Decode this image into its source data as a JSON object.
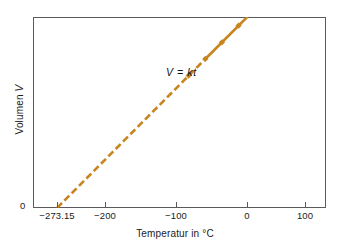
{
  "chart_data": {
    "type": "line",
    "title": "",
    "xlabel": "Temperatur in °C",
    "ylabel": "Volumen V",
    "annotation": "V = kt",
    "xlim": [
      -273.15,
      130
    ],
    "ylim": [
      0,
      1
    ],
    "grid": false,
    "legend": "none",
    "line_color": "#c8841e",
    "axis_color": "#5a5a5e",
    "x_ticks": [
      {
        "value": -273.15,
        "label": "−273.15",
        "px": 57
      },
      {
        "value": -200,
        "label": "−200",
        "px": 105
      },
      {
        "value": -100,
        "label": "−100",
        "px": 176
      },
      {
        "value": 0,
        "label": "0",
        "px": 247
      },
      {
        "value": 100,
        "label": "100",
        "px": 305
      }
    ],
    "y_origin_label": "0",
    "series": [
      {
        "name": "Volumen",
        "style_extrapolated": "dashed",
        "style_measured": "solid",
        "extrapolated_range": [
          -273.15,
          -50
        ],
        "measured_range": [
          -50,
          130
        ],
        "x": [
          -273.15,
          -200,
          -100,
          -75,
          -50,
          -25,
          0,
          30,
          130
        ],
        "y": [
          0.0,
          0.2597,
          0.6108,
          0.6986,
          0.7864,
          0.8742,
          0.9619,
          1.0673,
          1.4186
        ],
        "markers_x": [
          -75,
          -50,
          -25,
          0,
          30
        ]
      }
    ]
  },
  "figure": {
    "background": "#ffffff",
    "width": 350,
    "height": 251
  }
}
